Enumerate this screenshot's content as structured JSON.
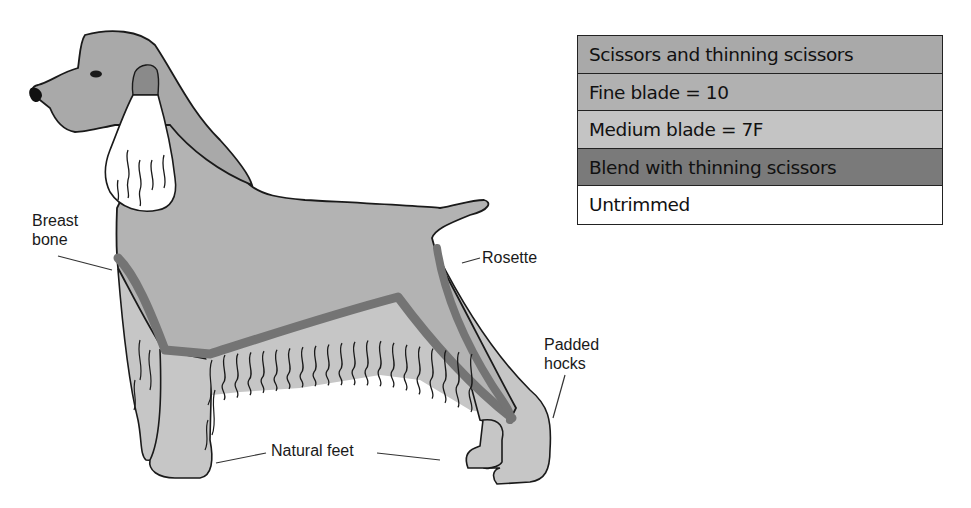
{
  "diagram": {
    "labels": {
      "breast_bone": [
        "Breast",
        "bone"
      ],
      "rosette": "Rosette",
      "padded_hocks": [
        "Padded",
        "hocks"
      ],
      "natural_feet": "Natural feet"
    },
    "colors": {
      "scissors": "#a9a9a9",
      "fine_blade": "#b3b3b3",
      "medium_blade": "#c6c6c6",
      "blend": "#747474",
      "untrimmed": "#ffffff",
      "outline": "#1a1a1a"
    }
  },
  "legend": {
    "items": [
      {
        "label": "Scissors and thinning scissors",
        "color": "#a9a9a9"
      },
      {
        "label": "Fine blade = 10",
        "color": "#b1b1b1"
      },
      {
        "label": "Medium blade = 7F",
        "color": "#c4c4c4"
      },
      {
        "label": "Blend with thinning scissors",
        "color": "#7a7a7a"
      },
      {
        "label": "Untrimmed",
        "color": "#ffffff"
      }
    ]
  }
}
